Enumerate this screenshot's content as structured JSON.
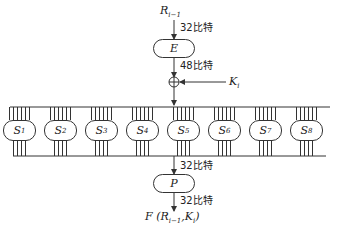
{
  "diagram": {
    "input": {
      "symbol": "R",
      "subscript": "i−1"
    },
    "expansion": {
      "label": "E"
    },
    "key": {
      "symbol": "K",
      "subscript": "i"
    },
    "permutation": {
      "label": "P"
    },
    "output": {
      "text": "F (R",
      "sub1": "i−1",
      "mid": ",K",
      "sub2": "i",
      "end": ")"
    },
    "bit_labels": {
      "input_to_e": "32比特",
      "e_to_xor": "48比特",
      "sbox_to_p": "32比特",
      "p_to_output": "32比特"
    },
    "sboxes": [
      {
        "symbol": "S",
        "index": "1"
      },
      {
        "symbol": "S",
        "index": "2"
      },
      {
        "symbol": "S",
        "index": "3"
      },
      {
        "symbol": "S",
        "index": "4"
      },
      {
        "symbol": "S",
        "index": "5"
      },
      {
        "symbol": "S",
        "index": "6"
      },
      {
        "symbol": "S",
        "index": "7"
      },
      {
        "symbol": "S",
        "index": "8"
      }
    ],
    "sbox_input_bits": 6,
    "sbox_output_bits": 4,
    "colors": {
      "line": "#333333",
      "text": "#222222",
      "background": "#ffffff"
    }
  }
}
